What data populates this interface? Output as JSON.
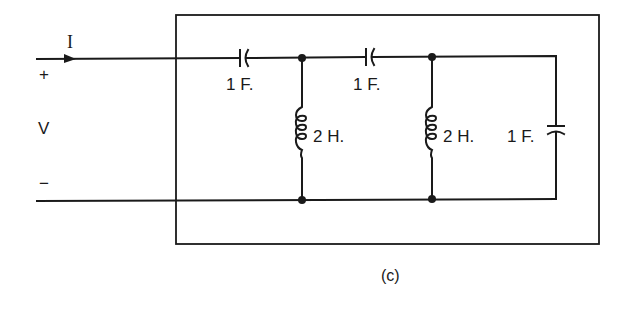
{
  "diagram": {
    "type": "circuit",
    "caption": "(c)",
    "terminals": {
      "current_label": "I",
      "plus": "+",
      "voltage_label": "V",
      "minus": "−"
    },
    "components": [
      {
        "id": "C1",
        "kind": "capacitor",
        "position": "series-top-first",
        "label": "1 F."
      },
      {
        "id": "L1",
        "kind": "inductor",
        "position": "shunt-first",
        "label": "2 H."
      },
      {
        "id": "C2",
        "kind": "capacitor",
        "position": "series-top-second",
        "label": "1 F."
      },
      {
        "id": "L2",
        "kind": "inductor",
        "position": "shunt-second",
        "label": "2 H."
      },
      {
        "id": "C3",
        "kind": "capacitor",
        "position": "shunt-end",
        "label": "1 F."
      }
    ],
    "nodes": [
      "node-1-top",
      "node-1-bottom",
      "node-2-top",
      "node-2-bottom"
    ],
    "enclosure": "two-port network box"
  },
  "colors": {
    "ink": "#1a1a1a",
    "background": "#ffffff"
  }
}
